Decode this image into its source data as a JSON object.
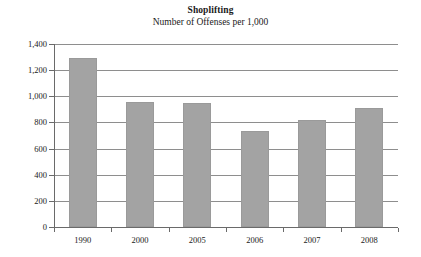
{
  "chart_data": {
    "type": "bar",
    "title": "Shoplifting",
    "subtitle": "Number of Offenses per 1,000",
    "xlabel": "",
    "ylabel": "",
    "categories": [
      "1990",
      "2000",
      "2005",
      "2006",
      "2007",
      "2008"
    ],
    "values": [
      1290,
      960,
      945,
      735,
      820,
      910
    ],
    "ylim": [
      0,
      1400
    ],
    "ytick_labels": [
      "0",
      "200",
      "400",
      "600",
      "800",
      "1,000",
      "1,200",
      "1,400"
    ],
    "ytick_values": [
      0,
      200,
      400,
      600,
      800,
      1000,
      1200,
      1400
    ],
    "grid": true,
    "legend": false,
    "legend_position": "none",
    "bar_color": "#a3a3a3",
    "axis_color": "#6a6a6a",
    "grid_color": "#8e8e8e",
    "series": [
      {
        "name": "Number of Offenses per 1,000",
        "values": [
          1290,
          960,
          945,
          735,
          820,
          910
        ]
      }
    ]
  }
}
